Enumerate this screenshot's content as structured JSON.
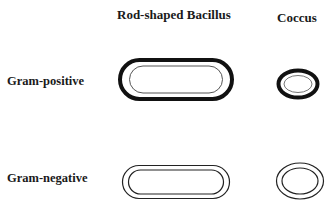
{
  "columns": [
    {
      "label": "Rod-shaped Bacillus"
    },
    {
      "label": "Coccus"
    }
  ],
  "rows": [
    {
      "label": "Gram-positive",
      "cell_wall": "thick outer wall with thin inner membrane"
    },
    {
      "label": "Gram-negative",
      "cell_wall": "two thin concentric membranes"
    }
  ],
  "colors": {
    "stroke": "#111111",
    "inner_stroke_positive": "#555555",
    "background": "#ffffff"
  }
}
